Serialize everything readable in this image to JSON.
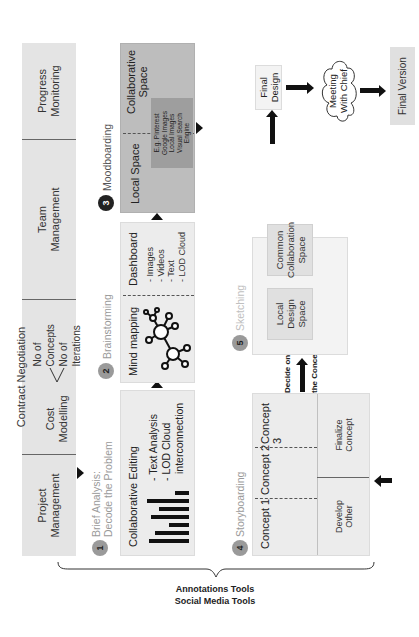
{
  "top_row": {
    "project_management": "Project Management",
    "contract_negotiation": "Contract Negotiation",
    "cost_modelling": "Cost Modelling",
    "no_of_concepts": "No of Concepts",
    "no_of_iterations": "No of Iterations",
    "team_management": "Team Management",
    "progress_monitoring": "Progress Monitoring"
  },
  "steps": [
    {
      "number": "1",
      "label_line1": "Brief Analysis:",
      "label_line2": "Decode the Problem",
      "heading": "Collaborative Editing",
      "items": [
        "- Text Analysis",
        "- LOD Cloud",
        "interconnection"
      ]
    },
    {
      "number": "2",
      "label": "Brainstorming",
      "left_heading": "Mind mapping",
      "right_heading": "Dashboard",
      "items": [
        "- Images",
        "- Videos",
        "- Text",
        "- LOD Cloud"
      ]
    },
    {
      "number": "3",
      "label": "Moodboarding",
      "left_heading": "Local Space",
      "right_heading_line1": "Collaborative",
      "right_heading_line2": "Space",
      "inner_items": [
        "E.g. Pinterest",
        "Google Images",
        "Local Images",
        "Visual Search",
        "Engine"
      ]
    },
    {
      "number": "4",
      "label": "Storyboarding",
      "concepts": [
        "Concept 1",
        "Concept 2",
        "Concept 3"
      ],
      "develop_line1": "Develop",
      "develop_line2": "Other",
      "finalize_line1": "Finalize",
      "finalize_line2": "Concept"
    },
    {
      "number": "5",
      "label": "Sketching",
      "local_design": [
        "Local",
        "Design",
        "Space"
      ],
      "common_collab": [
        "Common",
        "Collaboration",
        "Space"
      ]
    }
  ],
  "decide_label_line1": "Decide on",
  "decide_label_line2": "the Concept",
  "final_design_line1": "Final",
  "final_design_line2": "Design",
  "meeting_line1": "Meeting",
  "meeting_line2": "With Chief",
  "final_version": "Final Version",
  "brace_labels": {
    "line1": "Annotations Tools",
    "line2": "Social Media Tools"
  },
  "colors": {
    "box_light": "#ececec",
    "box_top": "#e4e4e4",
    "box_dark": "#bdbdbd",
    "inner_dark": "#9e9e9e",
    "step_circle_grey": "#9a9a9a",
    "step_circle_black": "#222222"
  }
}
